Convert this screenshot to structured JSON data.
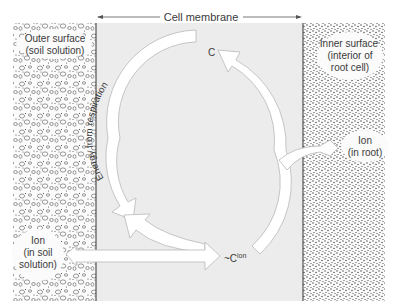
{
  "diagram": {
    "top_label": "Cell membrane",
    "left_region": {
      "title_line1": "Outer surface",
      "title_line2": "(soil solution)",
      "ion_line1": "Ion",
      "ion_line2": "(in soil",
      "ion_line3": "solution)"
    },
    "right_region": {
      "title_line1": "Inner surface",
      "title_line2": "(interior of",
      "title_line3": "root cell)",
      "ion_line1": "Ion",
      "ion_line2": "(in root)"
    },
    "carrier_label": "C",
    "carrier_complex_label": "~C",
    "carrier_complex_superscript": "ion",
    "energy_label": "Energy from respiration"
  },
  "colors": {
    "membrane_fill": "#ececec",
    "arrow_fill": "#ffffff",
    "arrow_stroke": "#b8b8b8",
    "text": "#3a3a3a"
  }
}
